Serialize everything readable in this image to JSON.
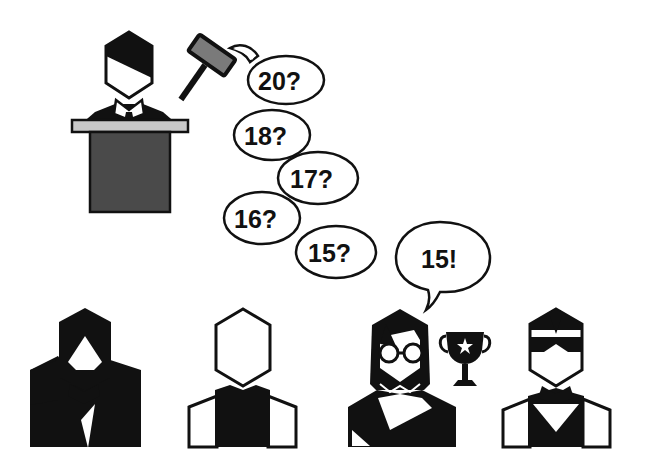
{
  "scene": {
    "title": "Reverse auction illustration",
    "colors": {
      "ink": "#111111",
      "podium_body": "#4a4a4a",
      "podium_top": "#c8c8c8",
      "gavel_head": "#7a7a7a",
      "background": "#ffffff"
    }
  },
  "auctioneer": {
    "role": "auctioneer",
    "bids": [
      {
        "label": "20?"
      },
      {
        "label": "18?"
      },
      {
        "label": "17?"
      },
      {
        "label": "16?"
      },
      {
        "label": "15?"
      }
    ]
  },
  "bidders": [
    {
      "role": "bidder-bearded"
    },
    {
      "role": "bidder-plain"
    },
    {
      "role": "bidder-glasses-winner",
      "reply": "15!",
      "award": "trophy-icon"
    },
    {
      "role": "bidder-masked"
    }
  ]
}
